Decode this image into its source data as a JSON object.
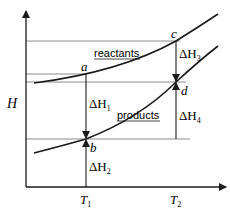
{
  "diagram": {
    "type": "enthalpy-temperature diagram",
    "axes": {
      "y_label": "H",
      "x_ticks": [
        {
          "label": "T",
          "sub": "1"
        },
        {
          "label": "T",
          "sub": "2"
        }
      ]
    },
    "curves": [
      {
        "label": "reactants"
      },
      {
        "label": "products"
      }
    ],
    "points": {
      "a": "a",
      "b": "b",
      "c": "c",
      "d": "d"
    },
    "deltas": [
      {
        "prefix": "ΔH",
        "sub": "1"
      },
      {
        "prefix": "ΔH",
        "sub": "2"
      },
      {
        "prefix": "ΔH",
        "sub": "3"
      },
      {
        "prefix": "ΔH",
        "sub": "4"
      }
    ],
    "colors": {
      "line": "#1a1a1a",
      "guide": "#8c8c8c"
    }
  }
}
